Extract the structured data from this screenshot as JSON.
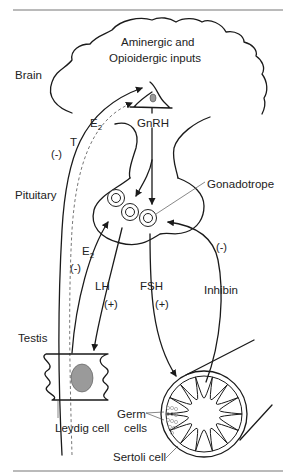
{
  "diagram": {
    "type": "hypothalamic-pituitary-testicular axis",
    "regions": {
      "brain": "Brain",
      "pituitary": "Pituitary",
      "testis": "Testis"
    },
    "inputs_line1": "Aminergic and",
    "inputs_line2": "Opioidergic inputs",
    "hormones": {
      "gnrh": "GnRH",
      "lh": "LH",
      "fsh": "FSH",
      "inhibin": "Inhibin",
      "testosterone": "T",
      "estradiol_base": "E",
      "estradiol_sub": "2"
    },
    "effects": {
      "negative": "(-)",
      "positive": "(+)"
    },
    "cells": {
      "gonadotrope": "Gonadotrope",
      "leydig": "Leydig cell",
      "germ_line1": "Germ",
      "germ_line2": "cells",
      "sertoli": "Sertoli cell"
    },
    "colors": {
      "line": "#1a1a1a",
      "nucleus_fill": "#9a9a9a",
      "rule": "#777777"
    }
  }
}
